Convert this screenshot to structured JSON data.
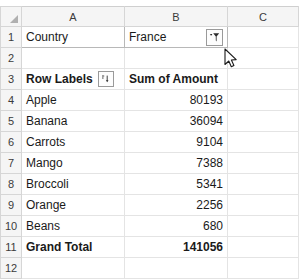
{
  "spreadsheet": {
    "select_all_label": "select-all",
    "column_headers": [
      "A",
      "B",
      "C"
    ],
    "row_numbers": [
      "1",
      "2",
      "3",
      "4",
      "5",
      "6",
      "7",
      "8",
      "9",
      "10",
      "11",
      "12"
    ],
    "report_filter": {
      "field_label": "Country",
      "selected_value": "France",
      "filter_button_icon": "funnel-filter-icon"
    },
    "pivot_headers": {
      "row_labels": "Row Labels",
      "row_labels_button_icon": "sort-filter-dropdown-icon",
      "value_header": "Sum of Amount"
    },
    "rows": [
      {
        "label": "Apple",
        "amount": "80193"
      },
      {
        "label": "Banana",
        "amount": "36094"
      },
      {
        "label": "Carrots",
        "amount": "9104"
      },
      {
        "label": "Mango",
        "amount": "7388"
      },
      {
        "label": "Broccoli",
        "amount": "5341"
      },
      {
        "label": "Orange",
        "amount": "2256"
      },
      {
        "label": "Beans",
        "amount": "680"
      }
    ],
    "grand_total": {
      "label": "Grand Total",
      "amount": "141056"
    },
    "colors": {
      "header_background": "#f5f5f5",
      "header_border": "#d6d6d6",
      "gridline": "#e4e4e4",
      "pivot_border": "#b8b8b8",
      "text": "#1a1a1a"
    }
  }
}
